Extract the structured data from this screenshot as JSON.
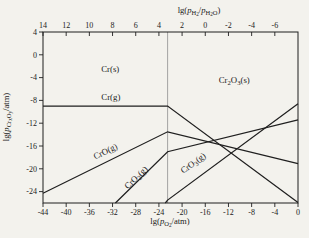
{
  "chart_data": {
    "type": "line",
    "title": "",
    "x_range": [
      -44,
      0
    ],
    "y_range": [
      4,
      -26
    ],
    "grid": false,
    "legend": "none",
    "colors": {
      "line": "#1f1f1f",
      "boundary": "#9a9a9a",
      "frame": "#1f1f1f",
      "text": "#1b1b1b",
      "background": "#f3f2ed"
    },
    "axes": {
      "top": {
        "title_segments": [
          {
            "t": "lg("
          },
          {
            "t": "p",
            "i": 1
          },
          {
            "t": "H",
            "s": 1
          },
          {
            "t": "2",
            "s": 2
          },
          {
            "t": "/"
          },
          {
            "t": "p",
            "i": 1
          },
          {
            "t": "H",
            "s": 1
          },
          {
            "t": "2",
            "s": 2
          },
          {
            "t": "O",
            "s": 1
          },
          {
            "t": ")"
          }
        ],
        "ticks": [
          {
            "at": -44,
            "label": "14"
          },
          {
            "at": -40,
            "label": "12"
          },
          {
            "at": -36,
            "label": "10"
          },
          {
            "at": -32,
            "label": "8"
          },
          {
            "at": -28,
            "label": "6"
          },
          {
            "at": -24,
            "label": "4"
          },
          {
            "at": -20,
            "label": "2"
          },
          {
            "at": -16,
            "label": "0"
          },
          {
            "at": -12,
            "label": "-2"
          },
          {
            "at": -8,
            "label": "-4"
          },
          {
            "at": -4,
            "label": "-6"
          }
        ]
      },
      "bottom": {
        "title_segments": [
          {
            "t": "lg("
          },
          {
            "t": "p",
            "i": 1
          },
          {
            "t": "O",
            "s": 1
          },
          {
            "t": "2",
            "s": 2
          },
          {
            "t": "/atm)"
          }
        ],
        "ticks": [
          {
            "v": -44,
            "label": "-44"
          },
          {
            "v": -40,
            "label": "-40"
          },
          {
            "v": -36,
            "label": "-36"
          },
          {
            "v": -32,
            "label": "-32"
          },
          {
            "v": -28,
            "label": "-28"
          },
          {
            "v": -24,
            "label": "-24"
          },
          {
            "v": -20,
            "label": "-20"
          },
          {
            "v": -16,
            "label": "-16"
          },
          {
            "v": -12,
            "label": "-12"
          },
          {
            "v": -8,
            "label": "-8"
          },
          {
            "v": -4,
            "label": "-4"
          },
          {
            "v": 0,
            "label": "0"
          }
        ]
      },
      "left": {
        "title_segments": [
          {
            "t": "lg("
          },
          {
            "t": "p",
            "i": 1
          },
          {
            "t": "Cr",
            "s": 1
          },
          {
            "t": "x",
            "s": 2
          },
          {
            "t": "O",
            "s": 1
          },
          {
            "t": "y",
            "s": 2
          },
          {
            "t": "/atm)"
          }
        ],
        "ticks": [
          {
            "v": 4,
            "label": "4"
          },
          {
            "v": 0,
            "label": "0"
          },
          {
            "v": -4,
            "label": "-4"
          },
          {
            "v": -8,
            "label": "-8"
          },
          {
            "v": -12,
            "label": "-12"
          },
          {
            "v": -16,
            "label": "-16"
          },
          {
            "v": -20,
            "label": "-20"
          },
          {
            "v": -24,
            "label": "-24"
          }
        ]
      }
    },
    "boundary": {
      "x": -22.5,
      "between": [
        "Cr(s)",
        "Cr2O3(s)"
      ]
    },
    "series": [
      {
        "id": "cr-g",
        "name": "Cr(g)",
        "points": [
          [
            -44,
            -9
          ],
          [
            -22.5,
            -9
          ],
          [
            0,
            -25.9
          ]
        ]
      },
      {
        "id": "cro-g",
        "name": "CrO(g)",
        "points": [
          [
            -44,
            -24.3
          ],
          [
            -22.5,
            -13.5
          ],
          [
            0,
            -19.1
          ]
        ]
      },
      {
        "id": "cro2-g",
        "name": "CrO2(g)",
        "points": [
          [
            -31.5,
            -26
          ],
          [
            -22.5,
            -17
          ],
          [
            0,
            -11.4
          ]
        ]
      },
      {
        "id": "cro3-g",
        "name": "CrO3(g)",
        "points": [
          [
            -22.9,
            -26
          ],
          [
            -22.5,
            -25.5
          ],
          [
            0,
            -8.6
          ]
        ]
      }
    ],
    "labels": [
      {
        "id": "cr-s",
        "x": -32.4,
        "y": -3,
        "rotate": 0,
        "segments": [
          {
            "t": "Cr(s)"
          }
        ]
      },
      {
        "id": "cr-g",
        "x": -32.3,
        "y": -8,
        "rotate": 0,
        "segments": [
          {
            "t": "Cr(g)"
          }
        ]
      },
      {
        "id": "cr2o3-s",
        "x": -11,
        "y": -4.9,
        "rotate": 0,
        "segments": [
          {
            "t": "Cr"
          },
          {
            "t": "2",
            "s": 1
          },
          {
            "t": "O"
          },
          {
            "t": "3",
            "s": 1
          },
          {
            "t": "(s)"
          }
        ]
      },
      {
        "id": "cro-g",
        "x": -33,
        "y": -17.4,
        "rotate": -26,
        "segments": [
          {
            "t": "CrO(g)"
          }
        ]
      },
      {
        "id": "cro2-g",
        "x": -27.6,
        "y": -21.9,
        "rotate": -44,
        "segments": [
          {
            "t": "CrO"
          },
          {
            "t": "2",
            "s": 1
          },
          {
            "t": "(g)"
          }
        ]
      },
      {
        "id": "cro3-g",
        "x": -17.8,
        "y": -19.4,
        "rotate": -36,
        "segments": [
          {
            "t": "CrO"
          },
          {
            "t": "3",
            "s": 1
          },
          {
            "t": "(g)"
          }
        ]
      }
    ]
  }
}
